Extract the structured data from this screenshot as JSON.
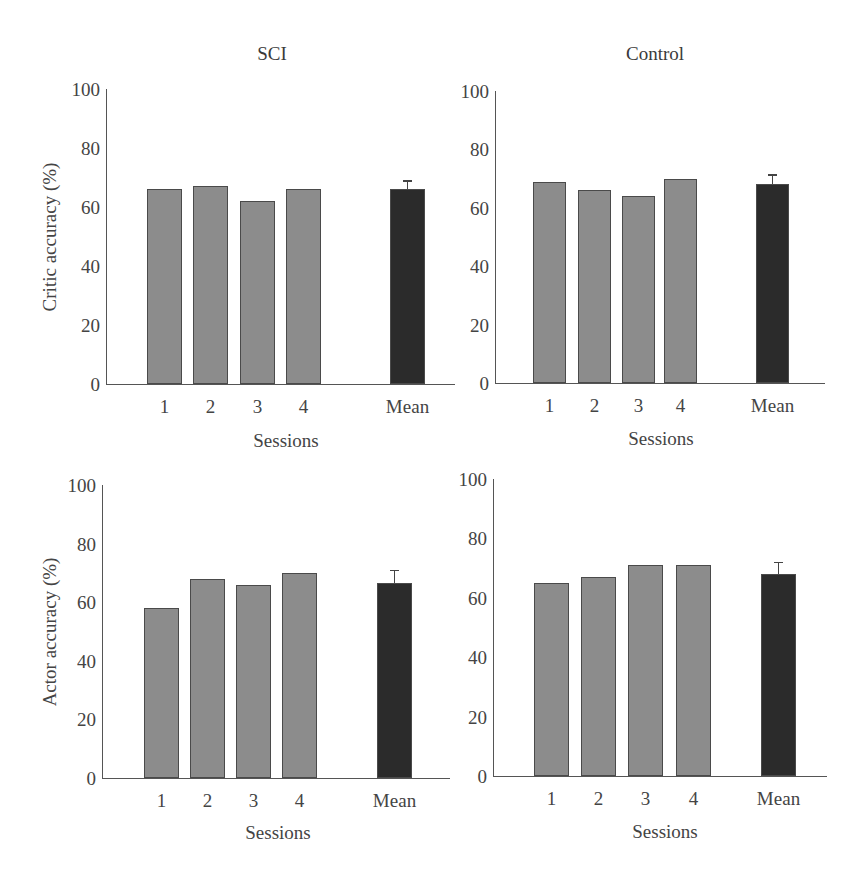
{
  "columns": {
    "left_title": "SCI",
    "right_title": "Control"
  },
  "colors": {
    "session_bar": "#8c8c8c",
    "mean_bar": "#2b2b2b",
    "axis": "#555555"
  },
  "chart_data": [
    {
      "type": "bar",
      "title": "SCI",
      "xlabel": "Sessions",
      "ylabel": "Critic accuracy (%)",
      "ylim": [
        0,
        100
      ],
      "yticks": [
        "0",
        "20",
        "40",
        "60",
        "80",
        "100"
      ],
      "categories": [
        "1",
        "2",
        "3",
        "4",
        "Mean"
      ],
      "values": [
        66,
        67,
        62,
        66,
        66
      ],
      "error": {
        "category": "Mean",
        "upper": 69
      },
      "grid": false,
      "legend": "none"
    },
    {
      "type": "bar",
      "title": "Control",
      "xlabel": "Sessions",
      "ylabel": "",
      "ylim": [
        0,
        100
      ],
      "yticks": [
        "0",
        "20",
        "40",
        "60",
        "80",
        "100"
      ],
      "categories": [
        "1",
        "2",
        "3",
        "4",
        "Mean"
      ],
      "values": [
        69,
        66,
        64,
        70,
        68
      ],
      "error": {
        "category": "Mean",
        "upper": 71.5
      },
      "grid": false,
      "legend": "none"
    },
    {
      "type": "bar",
      "title": "",
      "xlabel": "Sessions",
      "ylabel": "Actor accuracy (%)",
      "ylim": [
        0,
        100
      ],
      "yticks": [
        "0",
        "20",
        "40",
        "60",
        "80",
        "100"
      ],
      "categories": [
        "1",
        "2",
        "3",
        "4",
        "Mean"
      ],
      "values": [
        58,
        68,
        66,
        70,
        66.5
      ],
      "error": {
        "category": "Mean",
        "upper": 71
      },
      "grid": false,
      "legend": "none"
    },
    {
      "type": "bar",
      "title": "",
      "xlabel": "Sessions",
      "ylabel": "",
      "ylim": [
        0,
        100
      ],
      "yticks": [
        "0",
        "20",
        "40",
        "60",
        "80",
        "100"
      ],
      "categories": [
        "1",
        "2",
        "3",
        "4",
        "Mean"
      ],
      "values": [
        65,
        67,
        71,
        71,
        68
      ],
      "error": {
        "category": "Mean",
        "upper": 72
      },
      "grid": false,
      "legend": "none"
    }
  ]
}
